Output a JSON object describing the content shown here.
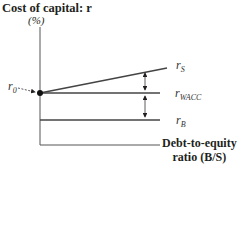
{
  "diagram": {
    "y_axis_title": "Cost of capital: r",
    "y_axis_unit": "(%)",
    "x_axis_title_line1": "Debt-to-equity",
    "x_axis_title_line2": "ratio (B/S)",
    "intercept_label": {
      "base": "r",
      "sub": "0"
    },
    "lines": [
      {
        "id": "rS",
        "base": "r",
        "sub": "S",
        "shape": "upward-sloping from r0"
      },
      {
        "id": "rWACC",
        "base": "r",
        "sub": "WACC",
        "shape": "horizontal at r0"
      },
      {
        "id": "rB",
        "base": "r",
        "sub": "B",
        "shape": "horizontal below r0"
      }
    ],
    "annotations": [
      "double-headed arrow between rS and rWACC",
      "double-headed arrow between rWACC and rB",
      "arrow pointing from r0 label to intercept dot"
    ]
  }
}
